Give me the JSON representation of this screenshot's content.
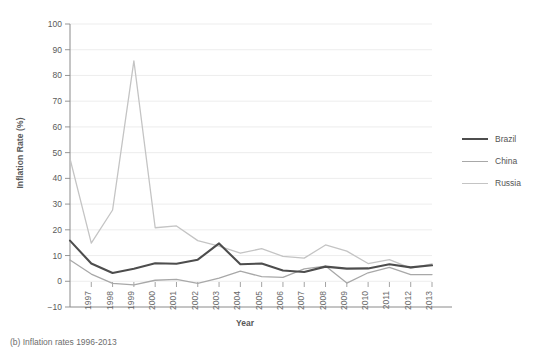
{
  "caption": "(b) Inflation rates 1996-2013",
  "legend": {
    "position": "right",
    "items": [
      {
        "label": "Brazil",
        "color": "#4d4d4d"
      },
      {
        "label": "China",
        "color": "#a8a8a8"
      },
      {
        "label": "Russia",
        "color": "#c4c4c4"
      }
    ]
  },
  "chart_data": {
    "type": "line",
    "title": "",
    "subtitle": "",
    "xlabel": "Year",
    "ylabel": "Inflation Rate (%)",
    "xlim": [
      1996,
      2013
    ],
    "ylim": [
      -10,
      100
    ],
    "ytick_step": 10,
    "grid": true,
    "legend_position": "right",
    "x": [
      1996,
      1997,
      1998,
      1999,
      2000,
      2001,
      2002,
      2003,
      2004,
      2005,
      2006,
      2007,
      2008,
      2009,
      2010,
      2011,
      2012,
      2013
    ],
    "xtick_labels": [
      "1997",
      "1998",
      "1999",
      "2000",
      "2001",
      "2002",
      "2003",
      "2004",
      "2005",
      "2006",
      "2007",
      "2008",
      "2009",
      "2010",
      "2011",
      "2012",
      "2013"
    ],
    "ytick_labels": [
      "-10",
      "0",
      "10",
      "20",
      "30",
      "40",
      "50",
      "60",
      "70",
      "80",
      "90",
      "100"
    ],
    "series": [
      {
        "name": "Brazil",
        "color": "#4d4d4d",
        "width": 2.1,
        "values": [
          15.8,
          6.9,
          3.2,
          4.9,
          7.0,
          6.8,
          8.4,
          14.7,
          6.6,
          6.9,
          4.2,
          3.6,
          5.7,
          4.9,
          5.0,
          6.6,
          5.4,
          6.2
        ]
      },
      {
        "name": "China",
        "color": "#a8a8a8",
        "width": 1.3,
        "values": [
          8.3,
          2.8,
          -0.8,
          -1.4,
          0.4,
          0.7,
          -0.8,
          1.2,
          3.9,
          1.8,
          1.5,
          4.8,
          5.9,
          -0.7,
          3.3,
          5.4,
          2.6,
          2.6
        ]
      },
      {
        "name": "Russia",
        "color": "#c4c4c4",
        "width": 1.3,
        "values": [
          47.7,
          14.8,
          27.7,
          85.7,
          20.8,
          21.5,
          15.8,
          13.7,
          10.9,
          12.7,
          9.7,
          9.0,
          14.1,
          11.7,
          6.9,
          8.4,
          5.1,
          6.8
        ]
      }
    ]
  }
}
